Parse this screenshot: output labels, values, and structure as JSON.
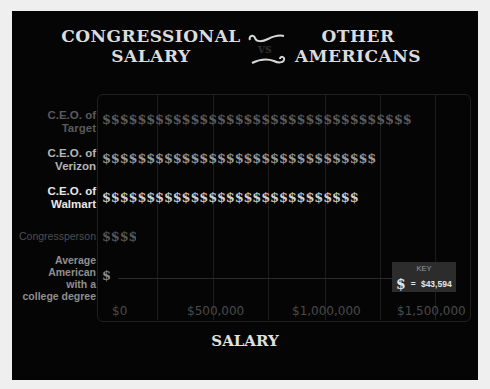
{
  "title": {
    "left_line1": "CONGRESSIONAL",
    "left_line2": "SALARY",
    "separator": "vs",
    "right_line1": "OTHER",
    "right_line2": "AMERICANS"
  },
  "key": {
    "title": "KEY",
    "symbol": "$",
    "equals": "=",
    "value": "$43,594"
  },
  "rows": [
    {
      "label_line1": "C.E.O. of",
      "label_line2": "Target",
      "symbols": 35,
      "color": "#5c5c5c",
      "label_color": "#5a5a5a"
    },
    {
      "label_line1": "C.E.O. of",
      "label_line2": "Verizon",
      "symbols": 30.4,
      "color": "#9a9a9a",
      "label_color": "#b5b5b5"
    },
    {
      "label_line1": "C.E.O. of",
      "label_line2": "Walmart",
      "symbols": 28.5,
      "color": "#cfcfcf",
      "label_color": "#e8e8e8"
    },
    {
      "label_line1": "Congressperson",
      "label_line2": "",
      "symbols": 3.3,
      "color": "#555555",
      "label_color": "#4e4e4e"
    },
    {
      "label_line1": "Average American",
      "label_line2": "with a college degree",
      "symbols": 1,
      "color": "#8a8a8a",
      "label_color": "#8f8f8f"
    }
  ],
  "axis": {
    "ticks": [
      "$0",
      "$500,000",
      "$1,000,000",
      "$1,500,000"
    ],
    "label": "SALARY"
  },
  "chart_data": {
    "type": "bar",
    "title": "Congressional Salary vs Other Americans",
    "xlabel": "SALARY",
    "ylabel": "",
    "orientation": "horizontal",
    "unit_symbol": "$ = $43,594",
    "categories": [
      "C.E.O. of Target",
      "C.E.O. of Verizon",
      "C.E.O. of Walmart",
      "Congressperson",
      "Average American with a college degree"
    ],
    "symbol_counts": [
      35,
      30.4,
      28.5,
      3.3,
      1
    ],
    "values": [
      1525790,
      1325258,
      1242429,
      143860,
      43594
    ],
    "xticks": [
      "$0",
      "$500,000",
      "$1,000,000",
      "$1,500,000"
    ],
    "xlim": [
      0,
      1600000
    ],
    "grid": true,
    "legend": {
      "position": "bottom-right",
      "entries": [
        "$ = $43,594"
      ]
    }
  }
}
